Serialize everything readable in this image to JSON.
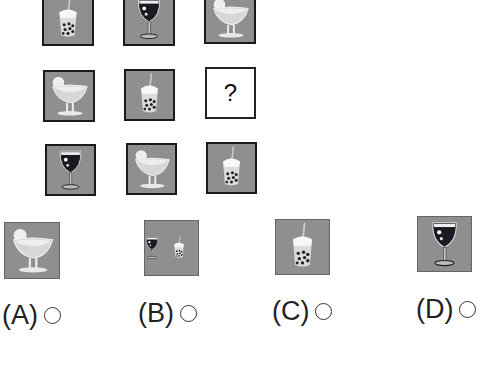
{
  "puzzle": {
    "grid": [
      [
        {
          "item": "bubble-tea"
        },
        {
          "item": "wine-glass"
        },
        {
          "item": "margarita-glass"
        }
      ],
      [
        {
          "item": "margarita-glass"
        },
        {
          "item": "bubble-tea"
        },
        {
          "item": "unknown",
          "text": "?"
        }
      ],
      [
        {
          "item": "wine-glass"
        },
        {
          "item": "margarita-glass"
        },
        {
          "item": "bubble-tea"
        }
      ]
    ],
    "missing_text": "?"
  },
  "options": [
    {
      "label": "(A)",
      "items": [
        "margarita-glass"
      ]
    },
    {
      "label": "(B)",
      "items": [
        "wine-glass",
        "bubble-tea"
      ]
    },
    {
      "label": "(C)",
      "items": [
        "bubble-tea"
      ]
    },
    {
      "label": "(D)",
      "items": [
        "wine-glass"
      ]
    }
  ],
  "colors": {
    "tile_bg": "#8f8f8f",
    "border": "#1a1a1a",
    "wine": "#1a1a22"
  }
}
